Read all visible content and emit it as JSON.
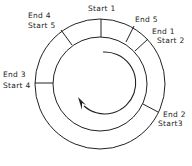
{
  "diagram": {
    "type": "circular-buffer-ring",
    "colors": {
      "stroke": "#222222",
      "background": "#ffffff"
    },
    "labels": {
      "start1": "Start 1",
      "end5": "End  5",
      "end1": "End  1",
      "start2": "Start 2",
      "end2": "End  2",
      "start3": "Start3",
      "end3": "End  3",
      "start4": "Start 4",
      "end4": "End  4",
      "start5": "Start  5"
    },
    "direction": "clockwise"
  }
}
